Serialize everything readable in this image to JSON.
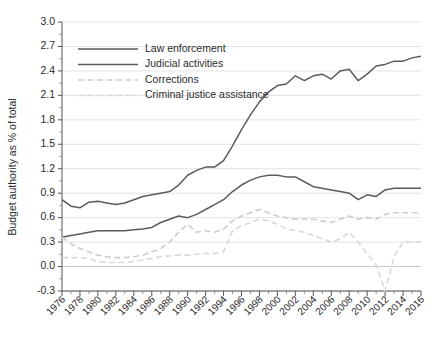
{
  "chart_data": {
    "type": "line",
    "title": "",
    "xlabel": "",
    "ylabel": "Budget authority as % of total",
    "xlim": [
      1976,
      2016
    ],
    "ylim": [
      -0.3,
      3.0
    ],
    "yticks": [
      -0.3,
      0.0,
      0.3,
      0.6,
      0.9,
      1.2,
      1.5,
      1.8,
      2.1,
      2.4,
      2.7,
      3.0
    ],
    "ytick_labels": [
      "-0.3",
      "0.0",
      "0.3",
      "0.6",
      "0.9",
      "1.2",
      "1.5",
      "1.8",
      "2.1",
      "2.4",
      "2.7",
      "3.0"
    ],
    "xticks": [
      1976,
      1978,
      1980,
      1982,
      1984,
      1986,
      1988,
      1990,
      1992,
      1994,
      1996,
      1998,
      2000,
      2002,
      2004,
      2006,
      2008,
      2010,
      2012,
      2014,
      2016
    ],
    "xtick_labels": [
      "1976",
      "1978",
      "1980",
      "1982",
      "1984",
      "1986",
      "1988",
      "1990",
      "1992",
      "1994",
      "1996",
      "1998",
      "2000",
      "2002",
      "2004",
      "2006",
      "2008",
      "2010",
      "2012",
      "2014",
      "2016"
    ],
    "x_minor_step": 1,
    "grid": "horizontal",
    "legend_position": "top-left",
    "x": [
      1976,
      1977,
      1978,
      1979,
      1980,
      1981,
      1982,
      1983,
      1984,
      1985,
      1986,
      1987,
      1988,
      1989,
      1990,
      1991,
      1992,
      1993,
      1994,
      1995,
      1996,
      1997,
      1998,
      1999,
      2000,
      2001,
      2002,
      2003,
      2004,
      2005,
      2006,
      2007,
      2008,
      2009,
      2010,
      2011,
      2012,
      2013,
      2014,
      2015,
      2016
    ],
    "series": [
      {
        "name": "Law enforcement",
        "color": "#5a5a60",
        "style": "solid",
        "values": [
          0.82,
          0.74,
          0.72,
          0.79,
          0.8,
          0.78,
          0.76,
          0.78,
          0.82,
          0.86,
          0.88,
          0.9,
          0.92,
          1.0,
          1.12,
          1.18,
          1.22,
          1.22,
          1.3,
          1.48,
          1.68,
          1.86,
          2.02,
          2.14,
          2.22,
          2.24,
          2.34,
          2.28,
          2.34,
          2.36,
          2.3,
          2.4,
          2.42,
          2.28,
          2.36,
          2.46,
          2.48,
          2.52,
          2.52,
          2.56,
          2.58
        ]
      },
      {
        "name": "Judicial activities",
        "color": "#5a5a60",
        "style": "solid",
        "values": [
          0.36,
          0.38,
          0.4,
          0.42,
          0.44,
          0.44,
          0.44,
          0.44,
          0.45,
          0.46,
          0.48,
          0.54,
          0.58,
          0.62,
          0.6,
          0.64,
          0.7,
          0.76,
          0.82,
          0.92,
          1.0,
          1.06,
          1.1,
          1.12,
          1.12,
          1.1,
          1.1,
          1.04,
          0.98,
          0.96,
          0.94,
          0.92,
          0.9,
          0.82,
          0.88,
          0.86,
          0.94,
          0.96,
          0.96,
          0.96,
          0.96
        ]
      },
      {
        "name": "Corrections",
        "color": "#cdcdcd",
        "style": "dashed",
        "values": [
          0.36,
          0.28,
          0.22,
          0.18,
          0.14,
          0.12,
          0.11,
          0.11,
          0.12,
          0.14,
          0.18,
          0.22,
          0.3,
          0.42,
          0.52,
          0.42,
          0.44,
          0.42,
          0.46,
          0.56,
          0.62,
          0.66,
          0.7,
          0.66,
          0.62,
          0.6,
          0.58,
          0.58,
          0.58,
          0.56,
          0.54,
          0.58,
          0.62,
          0.58,
          0.6,
          0.58,
          0.64,
          0.66,
          0.66,
          0.66,
          0.66
        ]
      },
      {
        "name": "Criminal justice assistance",
        "color": "#d9d9d9",
        "style": "dashed",
        "values": [
          0.11,
          0.11,
          0.11,
          0.1,
          0.06,
          0.05,
          0.05,
          0.05,
          0.06,
          0.08,
          0.1,
          0.12,
          0.13,
          0.14,
          0.14,
          0.15,
          0.16,
          0.16,
          0.18,
          0.44,
          0.5,
          0.54,
          0.58,
          0.56,
          0.52,
          0.46,
          0.44,
          0.42,
          0.38,
          0.34,
          0.3,
          0.34,
          0.42,
          0.3,
          0.16,
          0.02,
          -0.3,
          0.12,
          0.3,
          0.3,
          0.3
        ]
      }
    ]
  },
  "legend": {
    "items": [
      {
        "label": "Law enforcement"
      },
      {
        "label": "Judicial activities"
      },
      {
        "label": "Corrections"
      },
      {
        "label": "Criminal justice assistance"
      }
    ]
  }
}
